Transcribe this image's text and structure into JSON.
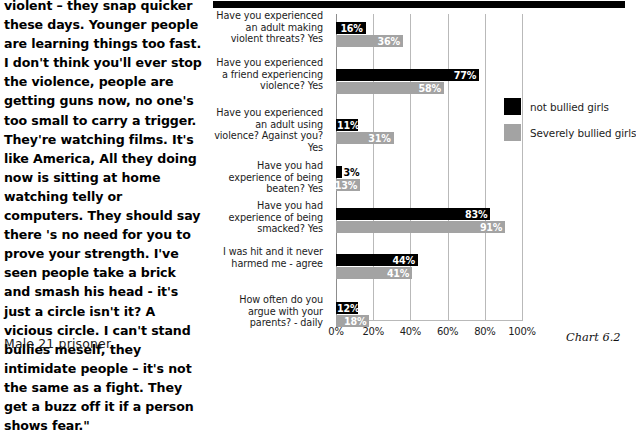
{
  "quote": {
    "text": "violent – they snap quicker these days. Younger people are learning things too fast. I don't think you'll ever stop the violence, people are getting guns now, no one's too small to carry a trigger. They're watching films. It's like America, All they doing now is sitting at home watching telly or computers. They should say there 's no need for you to prove your strength. I've seen people take a brick and smash his head - it's just a circle isn't it? A vicious circle. I can't stand bullies meself, they intimidate people – it's not the same as a fight. They get a buzz off it if a person shows fear.\"",
    "attribution": "Male 21 prisoner"
  },
  "caption": "Chart 6.2",
  "colors": {
    "not_bullied": "#000000",
    "severely_bullied": "#a3a3a3",
    "gridline": "#b9b9b9"
  },
  "chart_data": {
    "type": "bar",
    "orientation": "horizontal",
    "title": "",
    "xlabel": "",
    "ylabel": "",
    "xlim": [
      0,
      100
    ],
    "grid": true,
    "legend_position": "right",
    "tick_labels": [
      "0%",
      "20%",
      "40%",
      "60%",
      "80%",
      "100%"
    ],
    "ticks": [
      0,
      20,
      40,
      60,
      80,
      100
    ],
    "categories": [
      "Have you experienced an adult making violent threats? Yes",
      "Have you experienced a friend experiencing violence? Yes",
      "Have you experienced an adult using violence? Against you? Yes",
      "Have you had  experience of being beaten? Yes",
      "Have you had experience of being smacked? Yes",
      "I was hit and it never harmed me - agree",
      "How often do you argue with your parents? - daily"
    ],
    "series": [
      {
        "name": "not bullied girls",
        "color": "#000000",
        "values": [
          16,
          77,
          11,
          3,
          83,
          44,
          12
        ],
        "labels": [
          "16%",
          "77%",
          "11%",
          "3%",
          "83%",
          "44%",
          "12%"
        ]
      },
      {
        "name": "Severely bullied girls",
        "color": "#a3a3a3",
        "values": [
          36,
          58,
          31,
          13,
          91,
          41,
          18
        ],
        "labels": [
          "36%",
          "58%",
          "31%",
          "13%",
          "91%",
          "41%",
          "18%"
        ]
      }
    ]
  }
}
